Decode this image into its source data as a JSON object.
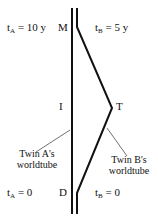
{
  "diagram": {
    "top_left": {
      "t": "t",
      "sub": "A",
      "rest": " = 10 y"
    },
    "top_right": {
      "t": "t",
      "sub": "B",
      "rest": " = 5 y"
    },
    "bottom_left": {
      "t": "t",
      "sub": "A",
      "rest": " = 0"
    },
    "bottom_right": {
      "t": "t",
      "sub": "B",
      "rest": " = 0"
    },
    "event_M": "M",
    "event_I": "I",
    "event_T": "T",
    "event_D": "D",
    "caption_A_line1": "Twin A's",
    "caption_A_line2": "worldtube",
    "caption_B_line1": "Twin B's",
    "caption_B_line2": "worldtube",
    "line_color": "#111111"
  }
}
